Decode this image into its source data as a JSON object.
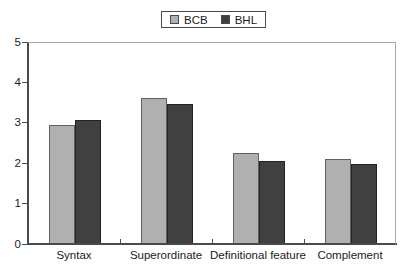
{
  "legend": {
    "items": [
      {
        "label": "BCB"
      },
      {
        "label": "BHL"
      }
    ]
  },
  "chart_data": {
    "type": "bar",
    "categories": [
      "Syntax",
      "Superordinate",
      "Definitional feature",
      "Complement"
    ],
    "series": [
      {
        "name": "BCB",
        "color": "#b0b0b0",
        "values": [
          2.93,
          3.58,
          2.24,
          2.08
        ]
      },
      {
        "name": "BHL",
        "color": "#404040",
        "values": [
          3.05,
          3.44,
          2.02,
          1.96
        ]
      }
    ],
    "title": "",
    "xlabel": "",
    "ylabel": "",
    "ylim": [
      0,
      5
    ],
    "yticks": [
      0,
      1,
      2,
      3,
      4,
      5
    ],
    "grid": false,
    "legend_position": "top-center"
  }
}
